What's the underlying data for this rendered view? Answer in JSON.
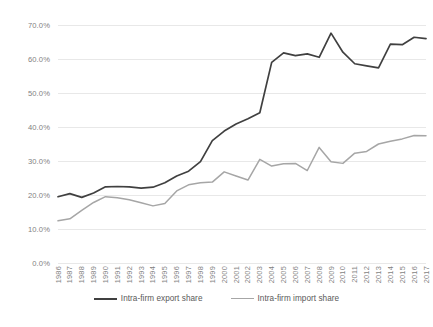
{
  "chart_data": {
    "type": "line",
    "title": "",
    "subtitle": "",
    "xlabel": "",
    "ylabel": "",
    "grid": true,
    "legend_position": "bottom",
    "ylim": [
      0,
      70
    ],
    "ytick_labels": [
      "0.0%",
      "10.0%",
      "20.0%",
      "30.0%",
      "40.0%",
      "50.0%",
      "60.0%",
      "70.0%"
    ],
    "ytick_values": [
      0,
      10,
      20,
      30,
      40,
      50,
      60,
      70
    ],
    "categories": [
      "1986",
      "1987",
      "1988",
      "1989",
      "1990",
      "1991",
      "1992",
      "1993",
      "1994",
      "1995",
      "1996",
      "1997",
      "1998",
      "1999",
      "2000",
      "2001",
      "2002",
      "2003",
      "2004",
      "2005",
      "2006",
      "2007",
      "2008",
      "2009",
      "2010",
      "2011",
      "2012",
      "2013",
      "2014",
      "2015",
      "2016",
      "2017"
    ],
    "series": [
      {
        "name": "Intra-firm export share",
        "color": "#404040",
        "values": [
          19.5,
          20.4,
          19.3,
          20.6,
          22.4,
          22.5,
          22.4,
          22.0,
          22.3,
          23.6,
          25.6,
          27.0,
          29.8,
          36.0,
          38.8,
          40.9,
          42.4,
          44.2,
          59.0,
          61.8,
          61.0,
          61.5,
          60.5,
          67.6,
          62.0,
          58.6,
          58.0,
          57.4,
          64.4,
          64.2,
          66.4,
          66.0
        ]
      },
      {
        "name": "Intra-firm import share",
        "color": "#a6a6a6",
        "values": [
          12.4,
          13.0,
          15.5,
          17.8,
          19.5,
          19.2,
          18.6,
          17.7,
          16.8,
          17.5,
          21.2,
          23.0,
          23.6,
          23.8,
          26.8,
          25.6,
          24.4,
          30.5,
          28.5,
          29.2,
          29.3,
          27.2,
          34.0,
          29.8,
          29.3,
          32.3,
          32.8,
          35.0,
          35.8,
          36.5,
          37.5,
          37.4
        ]
      }
    ]
  },
  "legend": {
    "items": [
      {
        "label": "Intra-firm export share",
        "color": "#404040"
      },
      {
        "label": "Intra-firm import share",
        "color": "#a6a6a6"
      }
    ]
  }
}
